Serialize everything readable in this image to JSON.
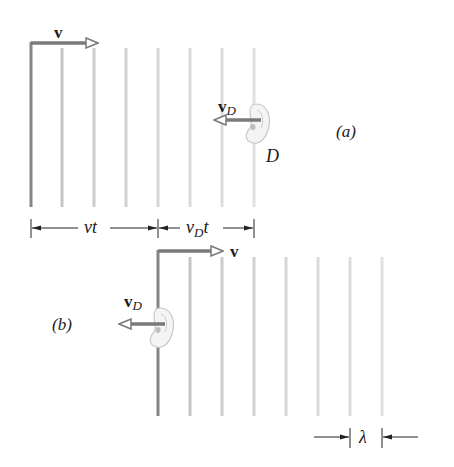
{
  "figure": {
    "panel_a": {
      "label": "(a)",
      "source_velocity_label": "v",
      "detector_velocity_label": "v",
      "detector_velocity_subscript": "D",
      "detector_label": "D",
      "dimension_left_label": "vt",
      "dimension_right_label_main": "v",
      "dimension_right_label_sub": "D",
      "dimension_right_label_tail": "t"
    },
    "panel_b": {
      "label": "(b)",
      "source_velocity_label": "v",
      "detector_velocity_label": "v",
      "detector_velocity_subscript": "D",
      "wavelength_label": "λ"
    },
    "colors": {
      "wavefront_leading": "#7a7a7a",
      "wavefront_fade": "#d9d9d9",
      "arrow": "#7a7a7a",
      "text": "#1a1a1a"
    }
  }
}
